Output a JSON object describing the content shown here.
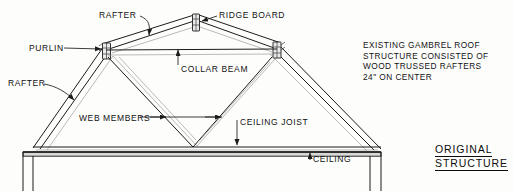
{
  "drawing": {
    "title_lines": [
      "ORIGINAL",
      "STRUCTURE"
    ],
    "note": {
      "lines": [
        "EXISTING GAMBREL ROOF",
        "STRUCTURE CONSISTED OF",
        "WOOD TRUSSED RAFTERS",
        "24\" ON CENTER"
      ]
    },
    "labels": {
      "rafter_top": "RAFTER",
      "ridge_board": "RIDGE BOARD",
      "purlin": "PURLIN",
      "rafter_left": "RAFTER",
      "collar_beam": "COLLAR BEAM",
      "web_members": "WEB MEMBERS",
      "ceiling_joist": "CEILING JOIST",
      "ceiling": "CEILING"
    },
    "colors": {
      "ink": "#1b1b1b",
      "paper": "#fdfdfc",
      "faint_line": "#8c8c8c",
      "gusset_fill": "#e9e9e9",
      "band_fill": "#d8d8d6"
    },
    "geometry": {
      "ridge_apex_x": 196,
      "ridge_apex_y": 17,
      "purlin_left": [
        106,
        47
      ],
      "purlin_right": [
        277,
        46
      ],
      "eave_left": [
        33,
        148
      ],
      "eave_right": [
        381,
        149
      ],
      "ceiling_y": 153
    }
  }
}
